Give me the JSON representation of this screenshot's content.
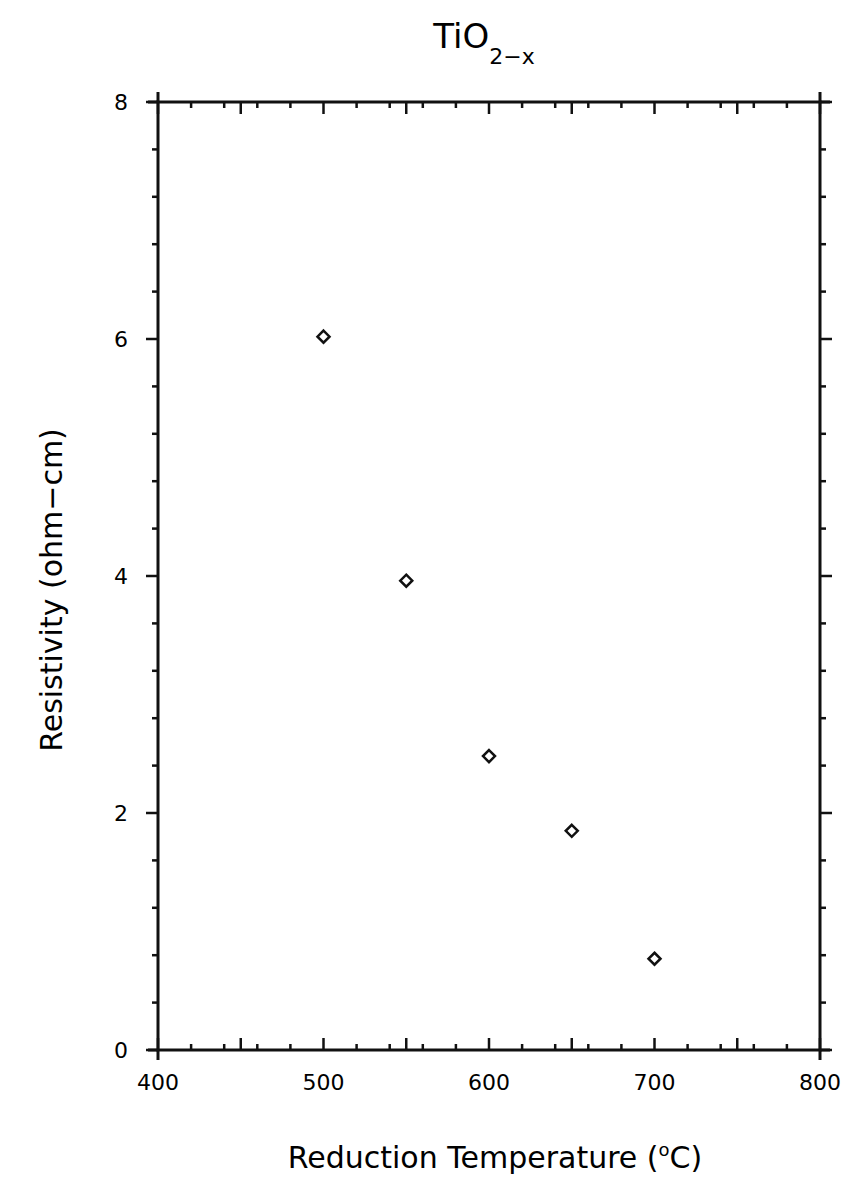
{
  "chart_data": {
    "type": "scatter",
    "title": "TiO",
    "title_subscript": "2−x",
    "xlabel": "Reduction  Temperature  (",
    "xlabel_degree": "o",
    "xlabel_unit": "C)",
    "ylabel": "Resistivity  (ohm−cm)",
    "xlim": [
      400,
      800
    ],
    "ylim": [
      0,
      8
    ],
    "x_ticks": [
      400,
      500,
      600,
      700,
      800
    ],
    "y_ticks": [
      0,
      2,
      4,
      6,
      8
    ],
    "x_tick_labels": [
      "400",
      "500",
      "600",
      "700",
      "800"
    ],
    "y_tick_labels": [
      "0",
      "2",
      "4",
      "6",
      "8"
    ],
    "grid": false,
    "legend": null,
    "marker": "open-diamond",
    "series": [
      {
        "name": "TiO2-x",
        "x": [
          500,
          550,
          600,
          650,
          700
        ],
        "y": [
          6.02,
          3.96,
          2.48,
          1.85,
          0.77
        ]
      }
    ]
  }
}
